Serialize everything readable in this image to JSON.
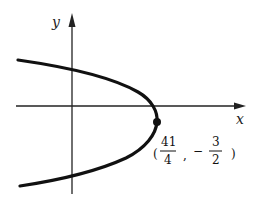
{
  "figure": {
    "x_axis_label": "x",
    "y_axis_label": "y",
    "vertex": {
      "x_numerator": "41",
      "x_denominator": "4",
      "y_sign": "−",
      "y_numerator": "3",
      "y_denominator": "2",
      "open_paren": "(",
      "comma": ",",
      "close_paren": ")"
    },
    "colors": {
      "curve": "#111111",
      "axes": "#222222"
    }
  }
}
